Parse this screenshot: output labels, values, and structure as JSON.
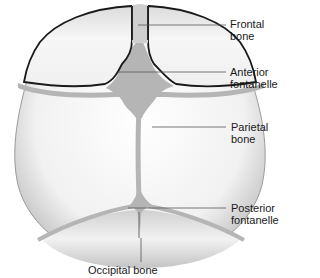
{
  "diagram": {
    "labels": [
      {
        "id": "frontal",
        "line1": "Frontal",
        "line2": "bone"
      },
      {
        "id": "anterior",
        "line1": "Anterior",
        "line2": "fontanelle"
      },
      {
        "id": "parietal",
        "line1": "Parietal",
        "line2": "bone"
      },
      {
        "id": "posterior",
        "line1": "Posterior",
        "line2": "fontanelle"
      },
      {
        "id": "occipital",
        "line1": "Occipital bone"
      }
    ],
    "colors": {
      "bone_light": "#f4f4f4",
      "bone_shade": "#bdbdbd",
      "suture": "#b5b5b5",
      "outline": "#1a1a1a",
      "leader": "#555555"
    }
  }
}
